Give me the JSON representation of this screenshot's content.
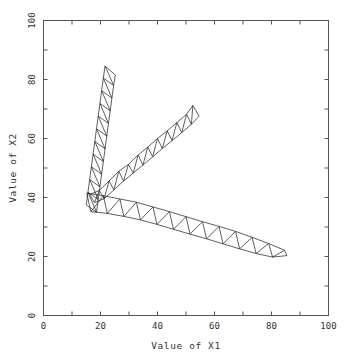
{
  "chart_data": {
    "type": "line",
    "title": "",
    "xlabel": "Value of X1",
    "ylabel": "Value of X2",
    "xlim": [
      0,
      100
    ],
    "ylim": [
      0,
      100
    ],
    "xticks": [
      0,
      10,
      20,
      30,
      40,
      50,
      60,
      70,
      80,
      90,
      100
    ],
    "yticks": [
      0,
      10,
      20,
      30,
      40,
      50,
      60,
      70,
      80,
      90,
      100
    ],
    "xticklabels": [
      "0",
      "20",
      "40",
      "60",
      "80",
      "100"
    ],
    "xticklabel_values": [
      0,
      20,
      40,
      60,
      80,
      100
    ],
    "yticklabels": [
      "0",
      "20",
      "40",
      "60",
      "80",
      "100"
    ],
    "yticklabel_values": [
      0,
      20,
      40,
      60,
      80,
      100
    ],
    "grid": false,
    "legend": false,
    "frame": "box",
    "series": [
      {
        "name": "branch-up",
        "style": "zigzag-triangle-strip",
        "color": "#2a2a2a",
        "rail_a": [
          [
            15.0,
            37.5
          ],
          [
            15.6,
            41.8
          ],
          [
            16.2,
            46.1
          ],
          [
            16.8,
            50.4
          ],
          [
            17.4,
            54.7
          ],
          [
            18.0,
            59.0
          ],
          [
            18.6,
            63.3
          ],
          [
            19.2,
            67.6
          ],
          [
            19.8,
            71.9
          ],
          [
            20.4,
            76.2
          ],
          [
            21.0,
            80.5
          ],
          [
            21.6,
            84.6
          ]
        ],
        "rail_b": [
          [
            18.6,
            35.0
          ],
          [
            19.2,
            39.3
          ],
          [
            19.8,
            43.6
          ],
          [
            20.4,
            47.9
          ],
          [
            21.0,
            52.2
          ],
          [
            21.6,
            56.5
          ],
          [
            22.2,
            60.8
          ],
          [
            22.8,
            65.1
          ],
          [
            23.4,
            69.4
          ],
          [
            24.0,
            73.7
          ],
          [
            24.6,
            78.0
          ],
          [
            25.2,
            81.5
          ]
        ]
      },
      {
        "name": "branch-upright",
        "style": "zigzag-triangle-strip",
        "color": "#2a2a2a",
        "rail_a": [
          [
            16.2,
            41.0
          ],
          [
            19.6,
            42.4
          ],
          [
            23.0,
            45.6
          ],
          [
            26.4,
            48.9
          ],
          [
            29.8,
            51.2
          ],
          [
            33.2,
            54.4
          ],
          [
            36.6,
            57.1
          ],
          [
            40.0,
            60.0
          ],
          [
            43.4,
            62.6
          ],
          [
            46.8,
            65.4
          ],
          [
            50.2,
            68.2
          ],
          [
            52.4,
            71.2
          ]
        ],
        "rail_b": [
          [
            17.9,
            38.3
          ],
          [
            21.3,
            39.6
          ],
          [
            24.7,
            42.6
          ],
          [
            28.1,
            45.6
          ],
          [
            31.5,
            48.3
          ],
          [
            34.9,
            51.0
          ],
          [
            38.3,
            53.8
          ],
          [
            41.7,
            56.6
          ],
          [
            45.1,
            59.3
          ],
          [
            48.5,
            62.0
          ],
          [
            51.9,
            64.8
          ],
          [
            54.6,
            67.6
          ]
        ]
      },
      {
        "name": "branch-downright",
        "style": "zigzag-triangle-strip",
        "color": "#2a2a2a",
        "rail_a": [
          [
            15.2,
            41.5
          ],
          [
            21.0,
            40.6
          ],
          [
            26.8,
            39.5
          ],
          [
            32.6,
            38.4
          ],
          [
            38.4,
            36.8
          ],
          [
            44.2,
            35.2
          ],
          [
            50.0,
            33.5
          ],
          [
            55.8,
            31.8
          ],
          [
            61.6,
            30.2
          ],
          [
            67.4,
            28.5
          ],
          [
            73.2,
            26.5
          ],
          [
            79.0,
            24.4
          ],
          [
            84.6,
            22.1
          ]
        ],
        "rail_b": [
          [
            16.6,
            35.2
          ],
          [
            22.4,
            34.6
          ],
          [
            28.2,
            33.6
          ],
          [
            34.0,
            32.4
          ],
          [
            39.8,
            30.9
          ],
          [
            45.6,
            29.2
          ],
          [
            51.4,
            27.6
          ],
          [
            57.2,
            26.0
          ],
          [
            63.0,
            24.3
          ],
          [
            68.8,
            22.6
          ],
          [
            74.6,
            21.0
          ],
          [
            80.4,
            19.8
          ],
          [
            85.4,
            20.3
          ]
        ]
      }
    ],
    "hub": [
      16.5,
      38.5
    ]
  },
  "axes": {
    "x_title": "Value of X1",
    "y_title": "Value of X2"
  }
}
